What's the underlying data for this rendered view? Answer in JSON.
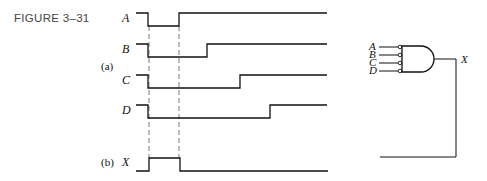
{
  "figure": {
    "label": "FIGURE 3–31",
    "part_a_label": "(a)",
    "part_b_label": "(b)"
  },
  "timing": {
    "signals": [
      {
        "name": "A",
        "sequence": "HIGH, LOW (t1–t2), HIGH"
      },
      {
        "name": "B",
        "sequence": "HIGH, LOW (t1–t3), HIGH"
      },
      {
        "name": "C",
        "sequence": "HIGH, LOW (t1–t4), HIGH"
      },
      {
        "name": "D",
        "sequence": "HIGH, LOW (t1–t5), HIGH"
      }
    ],
    "output": {
      "name": "X",
      "sequence": "LOW, HIGH (t1–t2), LOW"
    }
  },
  "gate": {
    "type": "AND gate with inverted (bubbled) inputs",
    "inputs": [
      "A",
      "B",
      "C",
      "D"
    ],
    "output": "X"
  },
  "colors": {
    "line": "#111111",
    "figure_label": "#444444",
    "dashed_guide": "#555555"
  }
}
